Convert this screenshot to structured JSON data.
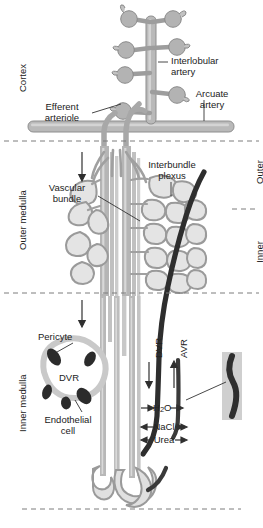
{
  "figure": {
    "width": 263,
    "height": 528,
    "background": "#ffffff"
  },
  "colors": {
    "vessel_fill": "#b9b9b9",
    "vessel_stroke": "#8a8a8a",
    "vessel_light": "#d6d6d6",
    "plexus_fill": "#e2e2e2",
    "dark_vessel": "#2e2e2e",
    "pericyte": "#2b2b2b",
    "endothelium": "#c9c9c9",
    "text": "#222222",
    "divider": "#7d7d7d",
    "leader": "#333333"
  },
  "zones": {
    "left_labels": [
      {
        "id": "cortex",
        "text": "Cortex"
      },
      {
        "id": "outer-medulla",
        "text": "Outer medulla"
      },
      {
        "id": "inner-medulla",
        "text": "Inner medulla"
      }
    ],
    "right_labels": [
      {
        "id": "outer-stripe",
        "line1": "Outer",
        "line2": "stripe"
      },
      {
        "id": "inner-stripe",
        "line1": "Inner",
        "line2": "stripe"
      }
    ],
    "dividers": [
      {
        "id": "cortex-outer-medulla",
        "y": 141
      },
      {
        "id": "outer-inner-medulla",
        "y": 293
      },
      {
        "id": "inner-medulla-bottom",
        "y": 509
      },
      {
        "id": "outer-inner-stripe",
        "y": 209
      }
    ]
  },
  "labels": {
    "interlobular_artery": "Interlobular\nartery",
    "arcuate_artery": "Arcuate\nartery",
    "efferent_arteriole": "Efferent\narteriole",
    "vascular_bundle": "Vascular\nbundle",
    "interbundle_plexus": "Interbundle\nplexus",
    "pericyte": "Pericyte",
    "dvr_inset": "DVR",
    "endothelial_cell": "Endothelial\ncell",
    "dvr_axis": "DVR",
    "avr_axis": "AVR"
  },
  "exchange": {
    "water": {
      "formula_pre": "H",
      "formula_sub": "2",
      "formula_post": "O",
      "direction": "outward"
    },
    "nacl": {
      "text": "NaCl",
      "direction": "inward"
    },
    "urea": {
      "text": "Urea",
      "direction": "inward"
    }
  },
  "structures": {
    "glomeruli_count": 7,
    "descending_vasa_recta": "DVR",
    "ascending_vasa_recta": "AVR",
    "pericyte_blobs": 5
  }
}
